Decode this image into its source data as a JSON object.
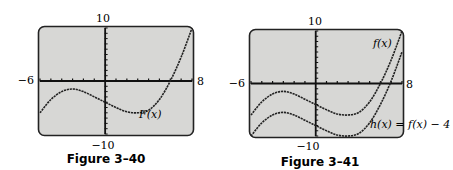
{
  "chart_data": [
    {
      "type": "line",
      "title": "Figure 3–40",
      "xlim": [
        -6,
        8
      ],
      "ylim": [
        -10,
        10
      ],
      "tick_labels": {
        "xmin": "−6",
        "xmax": "8",
        "ymax": "10",
        "ymin": "−10"
      },
      "grid": false,
      "series": [
        {
          "name": "F(x)",
          "x": [
            -6,
            -5,
            -4,
            -3,
            -2,
            -1,
            0,
            1,
            2,
            3,
            4,
            5,
            6,
            7,
            8
          ],
          "y": [
            -6,
            -3.5,
            -2,
            -1.5,
            -2,
            -3,
            -4,
            -5,
            -5.8,
            -6,
            -5.5,
            -3.5,
            0,
            4.5,
            10
          ]
        }
      ],
      "annotations": [
        "F(x)"
      ]
    },
    {
      "type": "line",
      "title": "Figure 3–41",
      "xlim": [
        -6,
        8
      ],
      "ylim": [
        -10,
        10
      ],
      "tick_labels": {
        "xmin": "−6",
        "xmax": "8",
        "ymax": "10",
        "ymin": "−10"
      },
      "grid": false,
      "series": [
        {
          "name": "f(x)",
          "x": [
            -6,
            -5,
            -4,
            -3,
            -2,
            -1,
            0,
            1,
            2,
            3,
            4,
            5,
            6,
            7,
            8
          ],
          "y": [
            -6,
            -3.5,
            -2,
            -1.5,
            -2,
            -3,
            -4,
            -5,
            -5.8,
            -6,
            -5.5,
            -3.5,
            0,
            4.5,
            10
          ]
        },
        {
          "name": "h(x) = f(x) − 4",
          "x": [
            -6,
            -5,
            -4,
            -3,
            -2,
            -1,
            0,
            1,
            2,
            3,
            4,
            5,
            6,
            7,
            8
          ],
          "y": [
            -10,
            -7.5,
            -6,
            -5.5,
            -6,
            -7,
            -8,
            -9,
            -9.8,
            -10,
            -9.5,
            -7.5,
            -4,
            0.5,
            6
          ]
        }
      ],
      "annotations": [
        "f(x)",
        "h(x) = f(x) − 4"
      ]
    }
  ],
  "figures": [
    {
      "caption": "Figure 3–40",
      "ymax": "10",
      "ymin": "−10",
      "xmin": "−6",
      "xmax": "8",
      "labels": [
        "F(x)"
      ]
    },
    {
      "caption": "Figure 3–41",
      "ymax": "10",
      "ymin": "−10",
      "xmin": "−6",
      "xmax": "8",
      "labels": [
        "f(x)",
        "h(x) = f(x) − 4"
      ]
    }
  ]
}
